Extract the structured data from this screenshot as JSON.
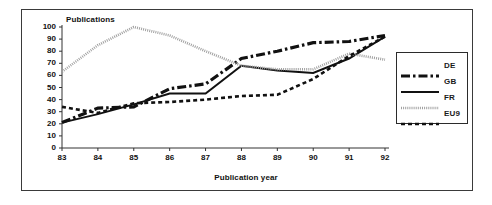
{
  "figure": {
    "background": "#ffffff",
    "frame_color": "#3a3a3a"
  },
  "chart_data": {
    "type": "line",
    "title": "",
    "ylabel": "Publications",
    "xlabel": "Publication year",
    "categories": [
      "83",
      "84",
      "85",
      "86",
      "87",
      "88",
      "89",
      "90",
      "91",
      "92"
    ],
    "x": [
      83,
      84,
      85,
      86,
      87,
      88,
      89,
      90,
      91,
      92
    ],
    "ylim": [
      0,
      100
    ],
    "xlim": [
      83,
      92
    ],
    "yticks": [
      "100",
      "90",
      "80",
      "70",
      "60",
      "50",
      "40",
      "30",
      "20",
      "10",
      "0"
    ],
    "ytick_values": [
      100,
      90,
      80,
      70,
      60,
      50,
      40,
      30,
      20,
      10,
      0
    ],
    "grid": false,
    "legend_position": "right",
    "series": [
      {
        "name": "DE",
        "color": "#111111",
        "style": "dash-dot",
        "values": [
          21,
          33,
          34,
          49,
          53,
          74,
          80,
          87,
          88,
          93
        ]
      },
      {
        "name": "GB",
        "color": "#111111",
        "style": "solid",
        "values": [
          21,
          28,
          36,
          45,
          45,
          68,
          64,
          62,
          74,
          92
        ]
      },
      {
        "name": "FR",
        "color": "#9a9a9a",
        "style": "hatched",
        "values": [
          63,
          85,
          100,
          93,
          80,
          68,
          65,
          65,
          78,
          73
        ]
      },
      {
        "name": "EU9",
        "color": "#111111",
        "style": "dashed",
        "values": [
          34,
          29,
          37,
          38,
          40,
          43,
          44,
          57,
          76,
          92
        ]
      }
    ]
  },
  "legend": {
    "items": [
      {
        "label": "DE"
      },
      {
        "label": "GB"
      },
      {
        "label": "FR"
      },
      {
        "label": "EU9"
      }
    ]
  }
}
